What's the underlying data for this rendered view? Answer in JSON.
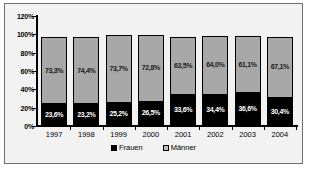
{
  "chart_data": {
    "type": "bar",
    "subtype": "stacked-percent-column",
    "title": "",
    "xlabel": "",
    "ylabel": "",
    "ylim": [
      0,
      120
    ],
    "y_ticks": [
      "0%",
      "20%",
      "40%",
      "60%",
      "80%",
      "100%",
      "120%"
    ],
    "y_tick_values": [
      0,
      20,
      40,
      60,
      80,
      100,
      120
    ],
    "grid": false,
    "legend_position": "bottom",
    "categories": [
      "1997",
      "1998",
      "1999",
      "2000",
      "2001",
      "2002",
      "2003",
      "2004"
    ],
    "series": [
      {
        "name": "Frauen",
        "color": "#000000",
        "values": [
          23.6,
          23.2,
          25.2,
          26.5,
          33.6,
          34.4,
          36.6,
          30.4
        ],
        "labels": [
          "23,6%",
          "23,2%",
          "25,2%",
          "26,5%",
          "33,6%",
          "34,4%",
          "36,6%",
          "30,4%"
        ]
      },
      {
        "name": "Männer",
        "color": "#a8a8a8",
        "values": [
          73.3,
          74.4,
          73.7,
          72.8,
          63.5,
          64.0,
          61.1,
          67.1
        ],
        "labels": [
          "73,3%",
          "74,4%",
          "73,7%",
          "72,8%",
          "63,5%",
          "64,0%",
          "61,1%",
          "67,1%"
        ]
      }
    ],
    "legend": [
      {
        "label": "Frauen",
        "color": "#000000"
      },
      {
        "label": "Männer",
        "color": "#bdbdbd"
      }
    ]
  }
}
